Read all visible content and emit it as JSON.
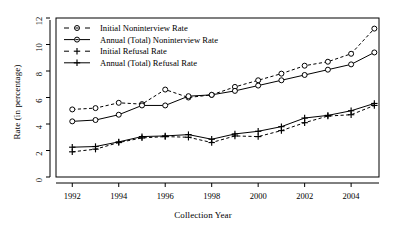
{
  "chart_data": {
    "type": "line",
    "title": "",
    "xlabel": "Collection Year",
    "ylabel": "Rate (in percentage)",
    "xlim": [
      1991.3,
      2005.2
    ],
    "ylim": [
      0,
      12
    ],
    "xticks": [
      1992,
      1994,
      1996,
      1998,
      2000,
      2002,
      2004
    ],
    "xticklabels": [
      "1992",
      "1994",
      "1996",
      "1998",
      "2000",
      "2002",
      "2004"
    ],
    "yticks": [
      0,
      2,
      4,
      6,
      8,
      10,
      12
    ],
    "yticklabels": [
      "0",
      "2",
      "4",
      "6",
      "8",
      "10",
      "12"
    ],
    "grid": false,
    "legend_position": "top-left-inside",
    "x": [
      1992,
      1993,
      1994,
      1995,
      1996,
      1997,
      1998,
      1999,
      2000,
      2001,
      2002,
      2003,
      2004,
      2005
    ],
    "series": [
      {
        "name": "Initial Noninterview Rate",
        "marker": "circle",
        "linestyle": "dashed",
        "values": [
          5.1,
          5.2,
          5.6,
          5.5,
          6.6,
          6.0,
          6.2,
          6.8,
          7.3,
          7.8,
          8.4,
          8.7,
          9.3,
          11.2
        ]
      },
      {
        "name": "Annual (Total) Noninterview Rate",
        "marker": "circle",
        "linestyle": "solid",
        "values": [
          4.2,
          4.3,
          4.7,
          5.4,
          5.4,
          6.1,
          6.2,
          6.5,
          6.9,
          7.3,
          7.7,
          8.1,
          8.5,
          9.4
        ]
      },
      {
        "name": "Initial Refusal Rate",
        "marker": "plus",
        "linestyle": "dashed",
        "values": [
          1.9,
          2.1,
          2.6,
          2.95,
          3.05,
          3.0,
          2.6,
          3.1,
          3.05,
          3.5,
          4.1,
          4.6,
          4.7,
          5.4
        ]
      },
      {
        "name": "Annual (Total) Refusal Rate",
        "marker": "plus",
        "linestyle": "solid",
        "values": [
          2.25,
          2.3,
          2.65,
          3.05,
          3.1,
          3.2,
          2.85,
          3.25,
          3.45,
          3.8,
          4.45,
          4.65,
          5.0,
          5.55
        ]
      }
    ],
    "legend": [
      {
        "label": "Initial Noninterview Rate",
        "marker": "circle",
        "linestyle": "dashed"
      },
      {
        "label": "Annual (Total) Noninterview Rate",
        "marker": "circle",
        "linestyle": "solid"
      },
      {
        "label": "Initial Refusal Rate",
        "marker": "plus",
        "linestyle": "dashed"
      },
      {
        "label": "Annual (Total) Refusal Rate",
        "marker": "plus",
        "linestyle": "solid"
      }
    ]
  }
}
